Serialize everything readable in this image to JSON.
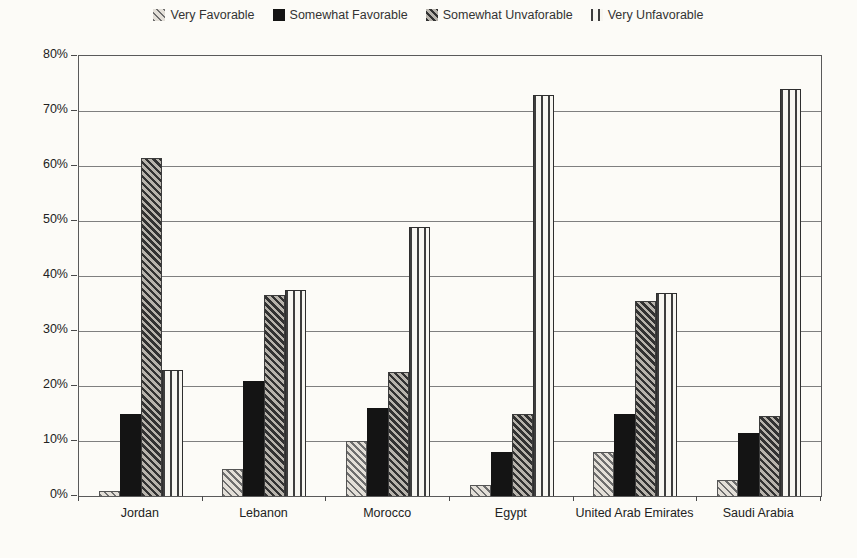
{
  "page": {
    "paper_color": "#fcfbf7"
  },
  "chart_data": {
    "type": "bar",
    "title": "",
    "xlabel": "",
    "ylabel": "",
    "categories": [
      "Jordan",
      "Lebanon",
      "Morocco",
      "Egypt",
      "United Arab Emirates",
      "Saudi Arabia"
    ],
    "series": [
      {
        "name": "Very Favorable",
        "pattern": "diagonal-hatch-light",
        "values": [
          1,
          5,
          10,
          2,
          8,
          3
        ]
      },
      {
        "name": "Somewhat Favorable",
        "pattern": "solid-black",
        "values": [
          15,
          21,
          16,
          8,
          15,
          11.5
        ]
      },
      {
        "name": "Somewhat Unvaforable",
        "pattern": "diagonal-hatch-dark",
        "values": [
          61.5,
          36.5,
          22.5,
          15,
          35.5,
          14.5
        ]
      },
      {
        "name": "Very Unfavorable",
        "pattern": "vertical-lines",
        "values": [
          23,
          37.5,
          49,
          73,
          37,
          74
        ]
      }
    ],
    "ylim": [
      0,
      80
    ],
    "ytick_step": 10,
    "ytick_labels": [
      "0%",
      "10%",
      "20%",
      "30%",
      "40%",
      "50%",
      "60%",
      "70%",
      "80%"
    ],
    "grid": true,
    "legend_position": "top",
    "colors": {
      "ink": "#2b2b2b",
      "grid": "#7f7f7f",
      "axis": "#5a5a5a",
      "solid_bar": "#141414",
      "paper": "#fcfbf7"
    }
  }
}
